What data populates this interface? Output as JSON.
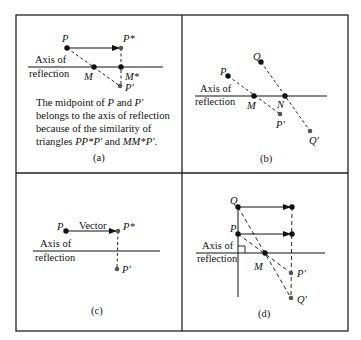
{
  "figure": {
    "panels": [
      {
        "id": "a",
        "caption": "(a)",
        "axis_label_line1": "Axis of",
        "axis_label_line2": "reflection",
        "points": {
          "P": "P",
          "P_star": "P*",
          "M": "M",
          "M_star": "M*",
          "P_prime": "P'"
        },
        "description": {
          "part1": "The midpoint of ",
          "P": "P",
          "part2": " and ",
          "P_prime": "P'",
          "part3": " belongs to the axis of reflection because of the similarity of triangles ",
          "tri1": "PP*P'",
          "part4": " and ",
          "tri2": "MM*P'",
          "part5": "."
        }
      },
      {
        "id": "b",
        "caption": "(b)",
        "axis_label_line1": "Axis of",
        "axis_label_line2": "reflection",
        "points": {
          "P": "P",
          "Q": "Q",
          "M": "M",
          "N": "N",
          "P_prime": "P'",
          "Q_prime": "Q'"
        }
      },
      {
        "id": "c",
        "caption": "(c)",
        "axis_label_line1": "Axis of",
        "axis_label_line2": "reflection",
        "vector_label": "Vector",
        "points": {
          "P": "P",
          "P_star": "P*",
          "P_prime": "P'"
        }
      },
      {
        "id": "d",
        "caption": "(d)",
        "axis_label_line1": "Axis of",
        "axis_label_line2": "reflection",
        "points": {
          "Q": "Q",
          "P": "P",
          "M": "M",
          "P_prime": "P'",
          "Q_prime": "Q'"
        }
      }
    ],
    "colors": {
      "ink": "#111111",
      "gray_point": "#555555",
      "border": "#222222"
    }
  }
}
